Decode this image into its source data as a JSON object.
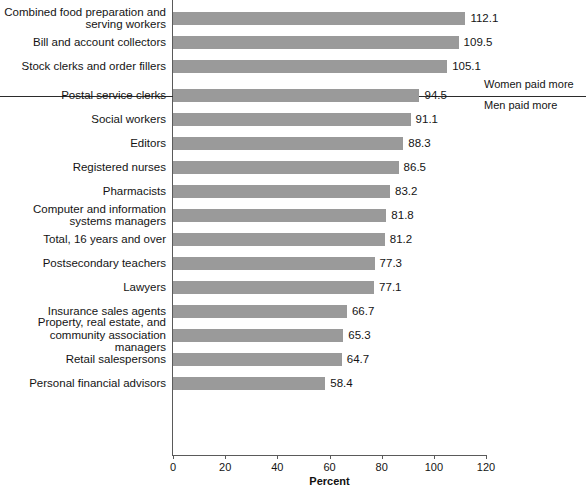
{
  "chart_data": {
    "type": "bar",
    "orientation": "horizontal",
    "title": "",
    "subtitle": "",
    "xlabel": "Percent",
    "ylabel": "",
    "xlim": [
      0,
      120
    ],
    "ylim": null,
    "grid": false,
    "legend_position": "none",
    "xticks": [
      0,
      20,
      40,
      60,
      80,
      100,
      120
    ],
    "xtick_labels": [
      "0",
      "20",
      "40",
      "60",
      "80",
      "100",
      "120"
    ],
    "bar_color": "#9a9a9a",
    "axis_color": "#5a5a5a",
    "categories": [
      "Combined food preparation and\nserving workers",
      "Bill and account collectors",
      "Stock clerks and order fillers",
      "Postal service clerks",
      "Social workers",
      "Editors",
      "Registered nurses",
      "Pharmacists",
      "Computer and information\nsystems managers",
      "Total, 16 years and over",
      "Postsecondary teachers",
      "Lawyers",
      "Insurance sales agents",
      "Property, real estate, and\ncommunity association managers",
      "Retail salespersons",
      "Personal financial advisors"
    ],
    "values": [
      112.1,
      109.5,
      105.1,
      94.5,
      91.1,
      88.3,
      86.5,
      83.2,
      81.8,
      81.2,
      77.3,
      77.1,
      66.7,
      65.3,
      64.7,
      58.4
    ],
    "value_labels": [
      "112.1",
      "109.5",
      "105.1",
      "94.5",
      "91.1",
      "88.3",
      "86.5",
      "83.2",
      "81.8",
      "81.2",
      "77.3",
      "77.1",
      "66.7",
      "65.3",
      "64.7",
      "58.4"
    ],
    "annotations": [
      {
        "text": "Women paid more",
        "position": "above-divider"
      },
      {
        "text": "Men paid more",
        "position": "below-divider"
      }
    ],
    "divider_after_index": 2
  }
}
